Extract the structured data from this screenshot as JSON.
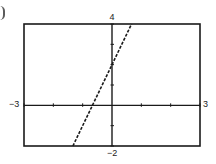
{
  "chart_data": {
    "type": "line",
    "title": "",
    "xlabel": "",
    "ylabel": "",
    "xlim": [
      -3,
      3
    ],
    "ylim": [
      -2,
      4
    ],
    "grid": false,
    "legend": null,
    "tick_labels": {
      "xmin": "-3",
      "xmax": "3",
      "ymin": "-2",
      "ymax": "4"
    },
    "x_ticks": [
      -3,
      -2,
      -1,
      0,
      1,
      2,
      3
    ],
    "y_ticks": [
      -2,
      -1,
      0,
      1,
      2,
      3,
      4
    ],
    "series": [
      {
        "name": "y = 3x + 2",
        "style": "dashed",
        "x": [
          -1.333,
          -0.667,
          0,
          0.667
        ],
        "y": [
          -2,
          0,
          2,
          4
        ]
      }
    ]
  },
  "labels": {
    "xmin": "−3",
    "xmax": "3",
    "ymin": "−2",
    "ymax": "4"
  },
  "colors": {
    "frame": "#1a1a1a",
    "axis": "#1a1a1a",
    "line": "#1a1a1a"
  }
}
